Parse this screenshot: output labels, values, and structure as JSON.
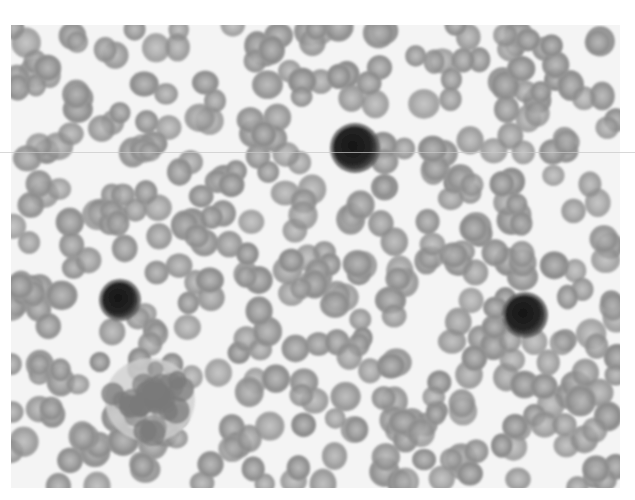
{
  "image": {
    "description": "Grayscale light micrograph of a peripheral blood smear",
    "frame": {
      "x": 11,
      "y": 25,
      "width": 609,
      "height": 463
    },
    "background_color": "#f4f4f4",
    "page_color": "#ffffff"
  },
  "colors": {
    "rbc_fill": "#8e8e8e",
    "rbc_center": "#b4b4b4",
    "nucleus": "#1e1e1e",
    "cytoplasm": "#5a5a5a",
    "clump": "#7a7a7a"
  },
  "nucleated_cells": [
    {
      "id": "nucleated-cell-top",
      "cx": 355,
      "cy": 148,
      "r": 22
    },
    {
      "id": "nucleated-cell-left",
      "cx": 120,
      "cy": 300,
      "r": 18
    },
    {
      "id": "nucleated-cell-right",
      "cx": 525,
      "cy": 315,
      "r": 20
    }
  ],
  "platelet_clump": {
    "cx": 150,
    "cy": 400,
    "rx": 45,
    "ry": 42
  },
  "scanline_y": 152
}
